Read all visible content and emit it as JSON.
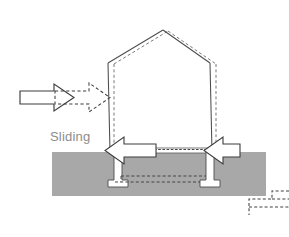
{
  "figure": {
    "title": "Sliding",
    "caption_label": "Sliding",
    "background_color": "#ffffff",
    "ground_color": "#a8a8a8",
    "line_color": "#4d4d4d",
    "dashed_color": "#555555",
    "label_color": "#8d8d8d",
    "fill_white": "#ffffff"
  },
  "labels": {
    "sliding": "Sliding"
  },
  "elements": {
    "ground_band": {
      "name": "ground",
      "x": 52,
      "y": 152,
      "width": 214,
      "height": 44,
      "color": "#a8a8a8"
    },
    "house_displaced": {
      "name": "house-displaced-outline",
      "style": "solid",
      "description": "Building outline shifted laterally to the right"
    },
    "house_original": {
      "name": "house-original-outline",
      "style": "dashed",
      "description": "Original undeformed building position"
    },
    "load_arrow_solid": {
      "name": "lateral-load-arrow-solid",
      "direction": "right",
      "style": "solid"
    },
    "load_arrow_dashed": {
      "name": "lateral-load-arrow-dashed",
      "direction": "right",
      "style": "dashed",
      "description": "Displaced position of load arrow"
    },
    "reaction_arrow_left": {
      "name": "reaction-arrow-left",
      "direction": "left",
      "style": "solid"
    },
    "reaction_arrow_right": {
      "name": "reaction-arrow-right",
      "direction": "left",
      "style": "solid"
    },
    "pier_left": {
      "name": "foundation-pier-left",
      "x": 112,
      "y": 152,
      "height": 36
    },
    "pier_right": {
      "name": "foundation-pier-right",
      "x": 210,
      "y": 152,
      "height": 36
    },
    "corner_bracket": {
      "name": "corner-dashed-bracket",
      "style": "dashed",
      "position": "bottom-right"
    }
  }
}
